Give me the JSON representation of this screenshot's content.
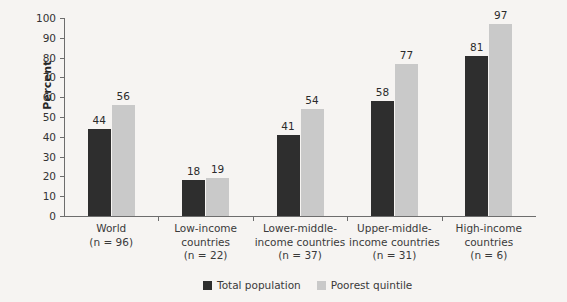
{
  "chart_data": {
    "type": "bar",
    "title": "",
    "xlabel": "",
    "ylabel": "Percent",
    "ylim": [
      0,
      100
    ],
    "ytick_step": 10,
    "grid": false,
    "legend_position": "bottom-right",
    "categories": [
      "World",
      "Low-income countries",
      "Lower-middle-income countries",
      "Upper-middle-income countries",
      "High-income countries"
    ],
    "category_lines": [
      [
        "World",
        "(n = 96)"
      ],
      [
        "Low-income",
        "countries",
        "(n = 22)"
      ],
      [
        "Lower-middle-",
        "income countries",
        "(n = 37)"
      ],
      [
        "Upper-middle-",
        "income countries",
        "(n = 31)"
      ],
      [
        "High-income",
        "countries",
        "(n = 6)"
      ]
    ],
    "sample_sizes": [
      96,
      22,
      37,
      31,
      6
    ],
    "series": [
      {
        "name": "Total population",
        "color": "#2e2e2e",
        "values": [
          44,
          18,
          41,
          58,
          81
        ]
      },
      {
        "name": "Poorest quintile",
        "color": "#c9c9c9",
        "values": [
          56,
          19,
          54,
          77,
          97
        ]
      }
    ],
    "yticks": [
      "0",
      "10",
      "20",
      "30",
      "40",
      "50",
      "60",
      "70",
      "80",
      "90",
      "100"
    ]
  },
  "legend": {
    "items": [
      {
        "label": "Total population",
        "swatch": "dark"
      },
      {
        "label": "Poorest quintile",
        "swatch": "light"
      }
    ]
  },
  "colors": {
    "background": "#f6f4f2",
    "axis": "#6d6d6d",
    "series_dark": "#2e2e2e",
    "series_light": "#c9c9c9",
    "text": "#3a3a3a"
  }
}
